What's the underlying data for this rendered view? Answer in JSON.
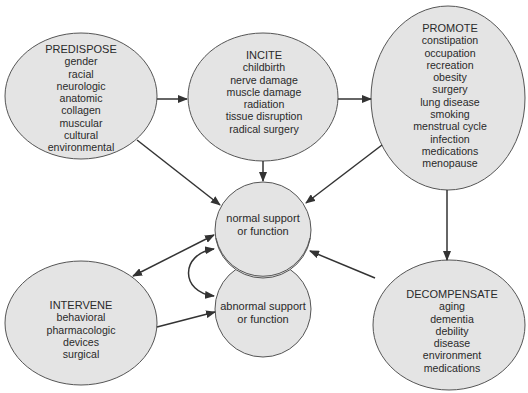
{
  "colors": {
    "node_fill": "#e4e4e4",
    "node_stroke": "#555555",
    "arrow": "#333333",
    "text": "#2a2a2a",
    "background": "#ffffff"
  },
  "nodes": {
    "predispose": {
      "title": "PREDISPOSE",
      "items": [
        "gender",
        "racial",
        "neurologic",
        "anatomic",
        "collagen",
        "muscular",
        "cultural",
        "environmental"
      ]
    },
    "incite": {
      "title": "INCITE",
      "items": [
        "childbirth",
        "nerve damage",
        "muscle damage",
        "radiation",
        "tissue disruption",
        "radical surgery"
      ]
    },
    "promote": {
      "title": "PROMOTE",
      "items": [
        "constipation",
        "occupation",
        "recreation",
        "obesity",
        "surgery",
        "lung disease",
        "smoking",
        "menstrual cycle",
        "infection",
        "medications",
        "menopause"
      ]
    },
    "normal": {
      "lines": [
        "normal support",
        "or function"
      ]
    },
    "abnormal": {
      "lines": [
        "abnormal support",
        "or function"
      ]
    },
    "intervene": {
      "title": "INTERVENE",
      "items": [
        "behavioral",
        "pharmacologic",
        "devices",
        "surgical"
      ]
    },
    "decompensate": {
      "title": "DECOMPENSATE",
      "items": [
        "aging",
        "dementia",
        "debility",
        "disease",
        "environment",
        "medications"
      ]
    }
  },
  "edges": [
    {
      "from": "predispose",
      "to": "incite",
      "direction": "forward"
    },
    {
      "from": "incite",
      "to": "promote",
      "direction": "forward"
    },
    {
      "from": "predispose",
      "to": "normal",
      "direction": "forward"
    },
    {
      "from": "incite",
      "to": "normal",
      "direction": "forward"
    },
    {
      "from": "promote",
      "to": "normal",
      "direction": "forward"
    },
    {
      "from": "promote",
      "to": "decompensate",
      "direction": "forward"
    },
    {
      "from": "decompensate",
      "to": "normal",
      "direction": "forward"
    },
    {
      "from": "intervene",
      "to": "normal",
      "direction": "both"
    },
    {
      "from": "intervene",
      "to": "abnormal",
      "direction": "forward"
    },
    {
      "from": "normal",
      "to": "abnormal",
      "direction": "both",
      "shape": "curved"
    }
  ]
}
